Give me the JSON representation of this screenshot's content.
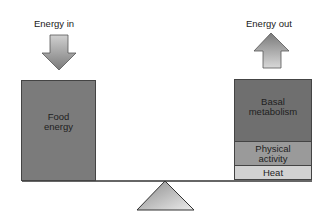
{
  "diagram": {
    "energy_in": {
      "label": "Energy in",
      "arrow": "down-arrow"
    },
    "energy_out": {
      "label": "Energy out",
      "arrow": "up-arrow"
    },
    "left_pan": {
      "items": [
        {
          "label": "Food energy",
          "line1": "Food",
          "line2": "energy",
          "color": "#7b7b7b"
        }
      ]
    },
    "right_pan": {
      "items": [
        {
          "label": "Basal metabolism",
          "line1": "Basal",
          "line2": "metabolism",
          "color": "#6f6f6f"
        },
        {
          "label": "Physical activity",
          "line1": "Physical",
          "line2": "activity",
          "color": "#9a9a9a"
        },
        {
          "label": "Heat",
          "line1": "Heat",
          "color": "#d2d2d2"
        }
      ]
    },
    "fulcrum": "balance-fulcrum"
  }
}
